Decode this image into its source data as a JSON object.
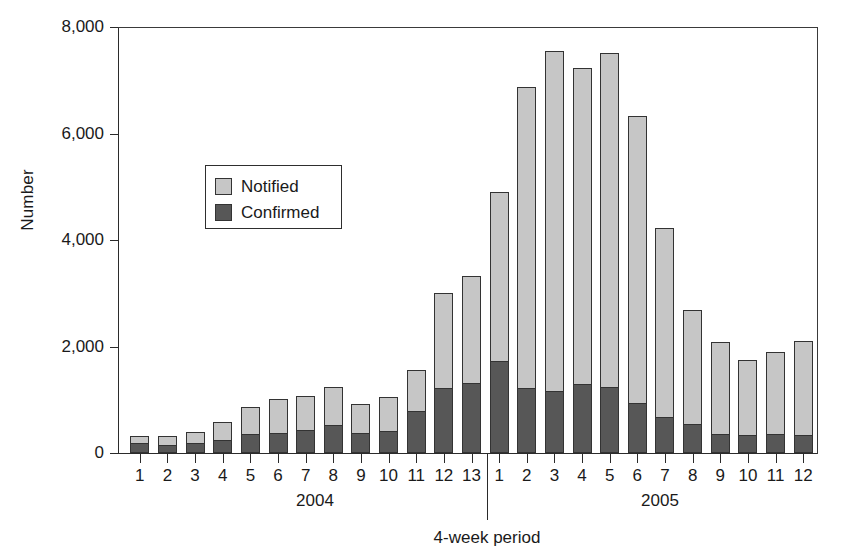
{
  "chart_data": {
    "type": "bar",
    "subtype": "stacked-vertical",
    "title": "",
    "xlabel": "4-week period",
    "ylabel": "Number",
    "ylim": [
      0,
      8000
    ],
    "y_ticks": [
      0,
      2000,
      4000,
      6000,
      8000
    ],
    "y_tick_labels": [
      "0",
      "2,000",
      "4,000",
      "6,000",
      "8,000"
    ],
    "grid": false,
    "legend_position": "upper-left-inside",
    "legend": [
      "Notified",
      "Confirmed"
    ],
    "colors": {
      "notified": "#c6c6c6",
      "confirmed": "#575757",
      "outline": "#333333",
      "axis": "#2a2a2a",
      "text": "#1a1a1a"
    },
    "group_labels": [
      "2004",
      "2005"
    ],
    "groups": [
      {
        "year": "2004",
        "periods": [
          "1",
          "2",
          "3",
          "4",
          "5",
          "6",
          "7",
          "8",
          "9",
          "10",
          "11",
          "12",
          "13"
        ]
      },
      {
        "year": "2005",
        "periods": [
          "1",
          "2",
          "3",
          "4",
          "5",
          "6",
          "7",
          "8",
          "9",
          "10",
          "11",
          "12"
        ]
      }
    ],
    "categories": [
      "2004-1",
      "2004-2",
      "2004-3",
      "2004-4",
      "2004-5",
      "2004-6",
      "2004-7",
      "2004-8",
      "2004-9",
      "2004-10",
      "2004-11",
      "2004-12",
      "2004-13",
      "2005-1",
      "2005-2",
      "2005-3",
      "2005-4",
      "2005-5",
      "2005-6",
      "2005-7",
      "2005-8",
      "2005-9",
      "2005-10",
      "2005-11",
      "2005-12"
    ],
    "tick_labels": [
      "1",
      "2",
      "3",
      "4",
      "5",
      "6",
      "7",
      "8",
      "9",
      "10",
      "11",
      "12",
      "13",
      "1",
      "2",
      "3",
      "4",
      "5",
      "6",
      "7",
      "8",
      "9",
      "10",
      "11",
      "12"
    ],
    "series": [
      {
        "name": "Confirmed",
        "color": "#575757",
        "values": [
          170,
          130,
          170,
          230,
          330,
          360,
          420,
          500,
          360,
          390,
          770,
          1200,
          1290,
          1700,
          1200,
          1150,
          1270,
          1230,
          920,
          660,
          530,
          330,
          320,
          340,
          320
        ]
      },
      {
        "name": "Notified",
        "color": "#c6c6c6",
        "note": "light segment stacked on top of Confirmed; value is the upper increment",
        "values": [
          150,
          180,
          230,
          350,
          530,
          660,
          650,
          740,
          560,
          650,
          790,
          1800,
          2020,
          3200,
          5680,
          6400,
          5960,
          6300,
          5410,
          3560,
          2160,
          1750,
          1430,
          1560,
          1780
        ]
      }
    ],
    "totals": [
      320,
      310,
      400,
      580,
      860,
      1020,
      1070,
      1240,
      920,
      1040,
      1560,
      3000,
      3310,
      4900,
      6880,
      7550,
      7230,
      7530,
      6330,
      4220,
      2690,
      2080,
      1750,
      1900,
      2100
    ]
  }
}
